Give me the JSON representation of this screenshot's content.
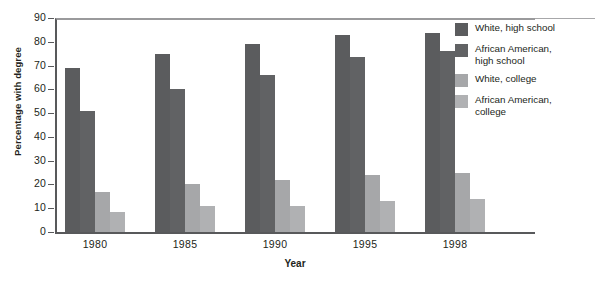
{
  "chart_data": {
    "type": "bar",
    "title": "",
    "xlabel": "Year",
    "ylabel": "Percentage with degree",
    "categories": [
      "1980",
      "1985",
      "1990",
      "1995",
      "1998"
    ],
    "ylim": [
      0,
      90
    ],
    "yticks": [
      0,
      10,
      20,
      30,
      40,
      50,
      60,
      70,
      80,
      90
    ],
    "grid": false,
    "legend_position": "right",
    "series": [
      {
        "name": "White, high school",
        "color": "#5b5c5e",
        "values": [
          69,
          75,
          79,
          83,
          83.5
        ]
      },
      {
        "name": "African American, high school",
        "color": "#616264",
        "values": [
          51,
          60,
          66,
          73.5,
          76
        ]
      },
      {
        "name": "White, college",
        "color": "#a6a7a9",
        "values": [
          17,
          20,
          22,
          24,
          25
        ]
      },
      {
        "name": "African American, college",
        "color": "#b0b1b3",
        "values": [
          8.5,
          11,
          11,
          13,
          14
        ]
      }
    ]
  },
  "axes": {
    "y_title": "Percentage with degree",
    "x_title": "Year",
    "y_tick_labels": [
      "90",
      "80",
      "70",
      "60",
      "50",
      "40",
      "30",
      "20",
      "10",
      "0"
    ],
    "x_tick_labels": [
      "1980",
      "1985",
      "1990",
      "1995",
      "1998"
    ]
  },
  "legend": {
    "items": [
      {
        "label": "White, high school",
        "color": "#5b5c5e"
      },
      {
        "label": "African American,\nhigh school",
        "color": "#616264"
      },
      {
        "label": "White, college",
        "color": "#a6a7a9"
      },
      {
        "label": "African American,\ncollege",
        "color": "#b0b1b3"
      }
    ]
  }
}
